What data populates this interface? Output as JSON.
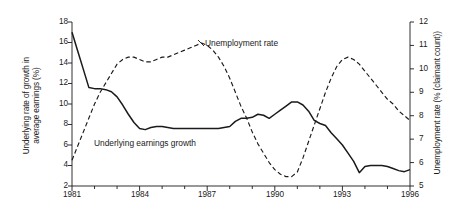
{
  "chart_data": {
    "type": "line",
    "title": "",
    "xlabel": "",
    "grid": false,
    "legend_position": "inline-annotations",
    "x_axis": {
      "min": 1981,
      "max": 1996,
      "tick_labels": [
        "1981",
        "1984",
        "1987",
        "1990",
        "1993",
        "1996"
      ],
      "tick_values": [
        1981,
        1984,
        1987,
        1990,
        1993,
        1996
      ],
      "minor_tick_step": 1
    },
    "y_axis_left": {
      "label_line1": "Underlying rate of growth in",
      "label_line2": "average earnings (%)",
      "min": 2,
      "max": 18,
      "tick_labels": [
        "18",
        "16",
        "14",
        "12",
        "10",
        "8",
        "6",
        "4",
        "2"
      ],
      "tick_values": [
        18,
        16,
        14,
        12,
        10,
        8,
        6,
        4,
        2
      ]
    },
    "y_axis_right": {
      "label": "Unemployment rate (% (claimant count))",
      "min": 5,
      "max": 12,
      "tick_labels": [
        "12",
        "11",
        "10",
        "9",
        "8",
        "7",
        "6",
        "5"
      ],
      "tick_values": [
        12,
        11,
        10,
        9,
        8,
        7,
        6,
        5
      ]
    },
    "series": [
      {
        "name": "Underlying earnings growth",
        "axis": "left",
        "style": "solid",
        "color": "#1a1a1a",
        "annotation_label": "Underlying earnings growth",
        "x": [
          1981.0,
          1981.25,
          1981.5,
          1981.75,
          1982.0,
          1982.25,
          1982.5,
          1982.75,
          1983.0,
          1983.25,
          1983.5,
          1983.75,
          1984.0,
          1984.25,
          1984.5,
          1984.75,
          1985.0,
          1985.5,
          1986.0,
          1986.5,
          1987.0,
          1987.5,
          1987.75,
          1988.0,
          1988.25,
          1988.5,
          1988.75,
          1989.0,
          1989.25,
          1989.5,
          1989.75,
          1990.0,
          1990.25,
          1990.5,
          1990.75,
          1991.0,
          1991.25,
          1991.5,
          1991.75,
          1992.0,
          1992.25,
          1992.5,
          1992.75,
          1993.0,
          1993.25,
          1993.5,
          1993.75,
          1994.0,
          1994.25,
          1994.5,
          1994.75,
          1995.0,
          1995.25,
          1995.5,
          1995.75,
          1996.0
        ],
        "values": [
          17.0,
          15.2,
          13.4,
          11.6,
          11.5,
          11.5,
          11.4,
          11.2,
          10.7,
          9.9,
          9.0,
          8.2,
          7.6,
          7.5,
          7.7,
          7.8,
          7.8,
          7.6,
          7.6,
          7.6,
          7.6,
          7.6,
          7.7,
          7.8,
          8.3,
          8.6,
          8.6,
          8.7,
          9.0,
          8.9,
          8.6,
          9.0,
          9.4,
          9.8,
          10.2,
          10.2,
          9.9,
          9.3,
          8.4,
          8.1,
          7.9,
          7.2,
          6.6,
          6.0,
          5.2,
          4.4,
          3.3,
          3.9,
          4.0,
          4.0,
          4.0,
          3.9,
          3.7,
          3.5,
          3.4,
          3.6
        ]
      },
      {
        "name": "Unemployment rate",
        "axis": "right",
        "style": "dashed",
        "color": "#1a1a1a",
        "annotation_label": "Unemployment rate",
        "x": [
          1981.0,
          1981.25,
          1981.5,
          1981.75,
          1982.0,
          1982.25,
          1982.5,
          1982.75,
          1983.0,
          1983.25,
          1983.5,
          1983.75,
          1984.0,
          1984.25,
          1984.5,
          1984.75,
          1985.0,
          1985.25,
          1985.5,
          1985.75,
          1986.0,
          1986.25,
          1986.5,
          1986.75,
          1987.0,
          1987.25,
          1987.5,
          1987.75,
          1988.0,
          1988.25,
          1988.5,
          1988.75,
          1989.0,
          1989.25,
          1989.5,
          1989.75,
          1990.0,
          1990.25,
          1990.5,
          1990.75,
          1991.0,
          1991.25,
          1991.5,
          1991.75,
          1992.0,
          1992.25,
          1992.5,
          1992.75,
          1993.0,
          1993.25,
          1993.5,
          1993.75,
          1994.0,
          1994.25,
          1994.5,
          1994.75,
          1995.0,
          1995.25,
          1995.5,
          1995.75,
          1996.0
        ],
        "values": [
          6.1,
          6.7,
          7.3,
          7.9,
          8.5,
          9.0,
          9.4,
          9.8,
          10.2,
          10.4,
          10.5,
          10.5,
          10.4,
          10.3,
          10.3,
          10.4,
          10.5,
          10.5,
          10.6,
          10.7,
          10.8,
          10.9,
          11.0,
          11.1,
          11.0,
          10.8,
          10.5,
          10.1,
          9.6,
          9.0,
          8.4,
          7.9,
          7.3,
          6.8,
          6.4,
          6.0,
          5.7,
          5.5,
          5.4,
          5.4,
          5.6,
          6.2,
          6.9,
          7.6,
          8.3,
          9.0,
          9.6,
          10.1,
          10.4,
          10.5,
          10.4,
          10.2,
          9.9,
          9.6,
          9.3,
          9.0,
          8.7,
          8.5,
          8.2,
          8.0,
          7.8
        ]
      }
    ]
  }
}
